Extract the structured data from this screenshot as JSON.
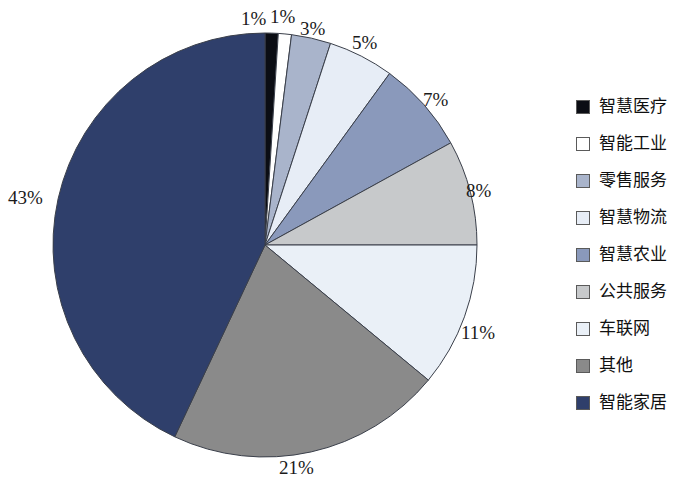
{
  "chart_data": {
    "type": "pie",
    "title": "",
    "subtitle": "",
    "xlabel": "",
    "ylabel": "",
    "legend_position": "right",
    "grid": false,
    "start_angle_deg": 0,
    "direction": "clockwise",
    "unit": "%",
    "categories": [
      "智慧医疗",
      "智能工业",
      "零售服务",
      "智慧物流",
      "智慧农业",
      "公共服务",
      "车联网",
      "其他",
      "智能家居"
    ],
    "values": [
      1,
      1,
      3,
      5,
      7,
      8,
      11,
      21,
      43
    ],
    "data_labels": [
      "1%",
      "1%",
      "3%",
      "5%",
      "7%",
      "8%",
      "11%",
      "21%",
      "43%"
    ],
    "colors": [
      "#0b0d14",
      "#ffffff",
      "#a9b4cb",
      "#e7edf6",
      "#8a99bb",
      "#c7c9cb",
      "#eaf0f7",
      "#8a8a8a",
      "#2f3f6b"
    ],
    "slice_outline_color": "#3a3f4a",
    "total": 100
  },
  "pie": {
    "center_x": 265,
    "center_y": 245,
    "radius": 212,
    "labels": [
      {
        "text": "1%",
        "category": "智慧医疗",
        "value": 1,
        "x": 241,
        "y": 8
      },
      {
        "text": "1%",
        "category": "智能工业",
        "value": 1,
        "x": 270,
        "y": 6
      },
      {
        "text": "3%",
        "category": "零售服务",
        "value": 3,
        "x": 300,
        "y": 18
      },
      {
        "text": "5%",
        "category": "智慧物流",
        "value": 5,
        "x": 352,
        "y": 32
      },
      {
        "text": "7%",
        "category": "智慧农业",
        "value": 7,
        "x": 423,
        "y": 89
      },
      {
        "text": "8%",
        "category": "公共服务",
        "value": 8,
        "x": 466,
        "y": 180
      },
      {
        "text": "11%",
        "category": "车联网",
        "value": 11,
        "x": 461,
        "y": 322
      },
      {
        "text": "21%",
        "category": "其他",
        "value": 21,
        "x": 279,
        "y": 457
      },
      {
        "text": "43%",
        "category": "智能家居",
        "value": 43,
        "x": 8,
        "y": 187
      }
    ]
  },
  "legend": {
    "items": [
      {
        "label": "智慧医疗",
        "color": "#0b0d14",
        "value": 1
      },
      {
        "label": "智能工业",
        "color": "#ffffff",
        "value": 1
      },
      {
        "label": "零售服务",
        "color": "#a9b4cb",
        "value": 3
      },
      {
        "label": "智慧物流",
        "color": "#e7edf6",
        "value": 5
      },
      {
        "label": "智慧农业",
        "color": "#8a99bb",
        "value": 7
      },
      {
        "label": "公共服务",
        "color": "#c7c9cb",
        "value": 8
      },
      {
        "label": "车联网",
        "color": "#eaf0f7",
        "value": 11
      },
      {
        "label": "其他",
        "color": "#8a8a8a",
        "value": 21
      },
      {
        "label": "智能家居",
        "color": "#2f3f6b",
        "value": 43
      }
    ]
  }
}
